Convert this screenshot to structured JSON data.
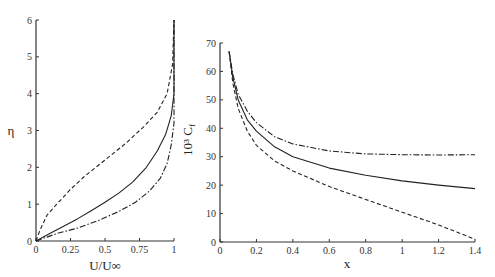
{
  "chart_data": [
    {
      "type": "line",
      "title": "",
      "xlabel": "U/U∞",
      "ylabel": "η",
      "xlim": [
        0,
        1
      ],
      "ylim": [
        0,
        6
      ],
      "xticks": [
        "0",
        "0.25",
        "0.5",
        "0.75",
        "1"
      ],
      "yticks": [
        "0",
        "1",
        "2",
        "3",
        "4",
        "5",
        "6"
      ],
      "grid": false,
      "legend": null,
      "series": [
        {
          "name": "solid",
          "style": "solid",
          "x": [
            0,
            0.1,
            0.2,
            0.3,
            0.4,
            0.5,
            0.6,
            0.7,
            0.8,
            0.88,
            0.94,
            0.98,
            1.0,
            1.0
          ],
          "y": [
            0,
            0.2,
            0.4,
            0.6,
            0.82,
            1.05,
            1.3,
            1.6,
            2.0,
            2.45,
            2.9,
            3.4,
            4.0,
            6.0
          ]
        },
        {
          "name": "dashed",
          "style": "dashed",
          "x": [
            0,
            0.03,
            0.08,
            0.15,
            0.25,
            0.35,
            0.5,
            0.65,
            0.78,
            0.88,
            0.95,
            0.99,
            1.0
          ],
          "y": [
            0,
            0.3,
            0.7,
            1.0,
            1.4,
            1.75,
            2.2,
            2.65,
            3.1,
            3.5,
            4.0,
            4.8,
            6.0
          ]
        },
        {
          "name": "dash-dot",
          "style": "dashdot",
          "x": [
            0,
            0.15,
            0.3,
            0.45,
            0.6,
            0.72,
            0.82,
            0.9,
            0.95,
            0.98,
            1.0,
            1.0
          ],
          "y": [
            0,
            0.2,
            0.35,
            0.55,
            0.8,
            1.05,
            1.35,
            1.7,
            2.1,
            2.6,
            3.2,
            6.0
          ]
        }
      ]
    },
    {
      "type": "line",
      "title": "",
      "xlabel": "x",
      "ylabel": "10³ C",
      "ylabel_subscript": "f",
      "xlim": [
        0,
        1.4
      ],
      "ylim": [
        0,
        70
      ],
      "xticks": [
        "0",
        "0.2",
        "0.4",
        "0.6",
        "0.8",
        "1",
        "1.2",
        "1.4"
      ],
      "yticks": [
        "0",
        "10",
        "20",
        "30",
        "40",
        "50",
        "60",
        "70"
      ],
      "grid": false,
      "legend": null,
      "series": [
        {
          "name": "solid",
          "style": "solid",
          "x": [
            0.05,
            0.07,
            0.1,
            0.15,
            0.2,
            0.3,
            0.4,
            0.6,
            0.8,
            1.0,
            1.2,
            1.4
          ],
          "y": [
            67,
            58,
            50,
            43,
            39,
            33.5,
            30,
            26,
            23.5,
            21.5,
            20,
            18.8
          ]
        },
        {
          "name": "dashed",
          "style": "dashed",
          "x": [
            0.05,
            0.07,
            0.1,
            0.15,
            0.2,
            0.3,
            0.4,
            0.6,
            0.8,
            1.0,
            1.2,
            1.3,
            1.4
          ],
          "y": [
            67,
            56,
            47,
            39,
            34,
            28.5,
            25,
            19.5,
            15,
            10.5,
            6,
            3.5,
            1
          ]
        },
        {
          "name": "dash-dot",
          "style": "dashdot",
          "x": [
            0.05,
            0.07,
            0.1,
            0.15,
            0.2,
            0.3,
            0.4,
            0.6,
            0.8,
            1.0,
            1.2,
            1.4
          ],
          "y": [
            67,
            59,
            52,
            46,
            42,
            37,
            34.5,
            32,
            31,
            30.7,
            30.6,
            30.7
          ]
        }
      ]
    }
  ]
}
